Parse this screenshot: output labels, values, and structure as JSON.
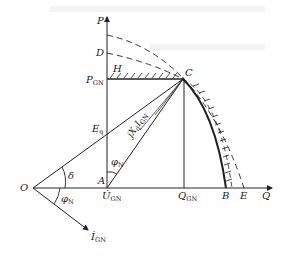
{
  "diagram": {
    "type": "generator P-Q capability chart (phasor diagram)",
    "axes": {
      "vertical": "P",
      "horizontal": "Q"
    },
    "points": {
      "origin": "O",
      "A": "A",
      "B": "B",
      "C": "C",
      "D": "D",
      "E": "E",
      "H": "H"
    },
    "labels": {
      "P": "P",
      "Q": "Q",
      "O": "O",
      "A": "A",
      "B": "B",
      "C": "C",
      "D": "D",
      "E": "E",
      "H": "H",
      "P_GN_main": "P",
      "P_GN_sub": "GN",
      "Q_GN_main": "Q",
      "Q_GN_sub": "GN",
      "U_GN_main": "U̇",
      "U_GN_sub": "GN",
      "I_GN_main": "İ",
      "I_GN_sub": "GN",
      "Eq_main": "E",
      "Eq_sub": "q",
      "jXdI_main": "jX",
      "jXdI_sub1": "d",
      "jXdI_mid": "I",
      "jXdI_sub2": "GN",
      "delta": "δ",
      "phi_N_main": "φ",
      "phi_N_sub": "N"
    },
    "colors": {
      "line": "#222222",
      "background": "#ffffff"
    }
  }
}
